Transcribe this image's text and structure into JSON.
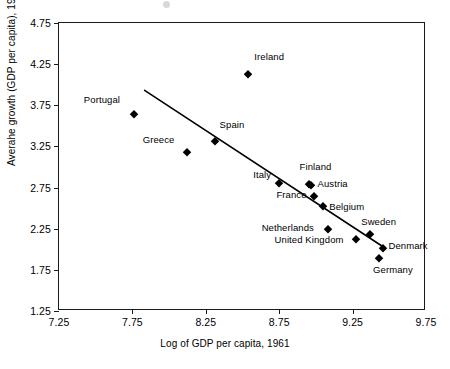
{
  "chart_data": {
    "type": "scatter",
    "title": "",
    "xlabel": "Log of GDP per capita, 1961",
    "ylabel": "Averahe growth (GDP per capita), 1961-2003",
    "xlim": [
      7.25,
      9.75
    ],
    "ylim": [
      1.25,
      4.75
    ],
    "xticks": [
      "7.25",
      "7.75",
      "8.25",
      "8.75",
      "9.25",
      "9.75"
    ],
    "yticks": [
      "4.75",
      "4.25",
      "3.75",
      "3.25",
      "2.75",
      "2.25",
      "1.75",
      "1.25"
    ],
    "grid": false,
    "legend": "none",
    "series": [
      {
        "name": "Countries",
        "points": [
          {
            "label": "Ireland",
            "x": 8.54,
            "y": 4.13
          },
          {
            "label": "Portugal",
            "x": 7.76,
            "y": 3.64
          },
          {
            "label": "Spain",
            "x": 8.31,
            "y": 3.32
          },
          {
            "label": "Greece",
            "x": 8.12,
            "y": 3.18
          },
          {
            "label": "Finland",
            "x": 8.95,
            "y": 2.79
          },
          {
            "label": "Italy",
            "x": 8.75,
            "y": 2.81
          },
          {
            "label": "Austria",
            "x": 8.97,
            "y": 2.78
          },
          {
            "label": "France",
            "x": 8.99,
            "y": 2.65
          },
          {
            "label": "Belgium",
            "x": 9.05,
            "y": 2.53
          },
          {
            "label": "Netherlands",
            "x": 9.08,
            "y": 2.25
          },
          {
            "label": "Sweden",
            "x": 9.37,
            "y": 2.19
          },
          {
            "label": "United Kingdom",
            "x": 9.27,
            "y": 2.13
          },
          {
            "label": "Denmark",
            "x": 9.46,
            "y": 2.01
          },
          {
            "label": "Germany",
            "x": 9.43,
            "y": 1.9
          }
        ]
      }
    ],
    "trend_line": {
      "name": "fitted regression line",
      "x_start": 7.84,
      "y_start": 3.92,
      "x_end": 9.48,
      "y_end": 2.0
    }
  },
  "axes": {
    "y_title": "Averahe growth (GDP per capita), 1961-2003",
    "x_title": "Log of GDP per capita, 1961",
    "y_tick_labels": [
      "4.75",
      "4.25",
      "3.75",
      "3.25",
      "2.75",
      "2.25",
      "1.75",
      "1.25"
    ],
    "x_tick_labels": [
      "7.25",
      "7.75",
      "8.25",
      "8.75",
      "9.25",
      "9.75"
    ]
  },
  "labels": {
    "ireland": "Ireland",
    "portugal": "Portugal",
    "spain": "Spain",
    "greece": "Greece",
    "finland": "Finland",
    "italy": "Italy",
    "austria": "Austria",
    "france": "France",
    "belgium": "Belgium",
    "netherlands": "Netherlands",
    "sweden": "Sweden",
    "united_kingdom": "United Kingdom",
    "denmark": "Denmark",
    "germany": "Germany"
  },
  "colors": {
    "axis": "#1a1a1a",
    "marker": "#000000",
    "trend_line": "#000000",
    "background": "#ffffff"
  }
}
